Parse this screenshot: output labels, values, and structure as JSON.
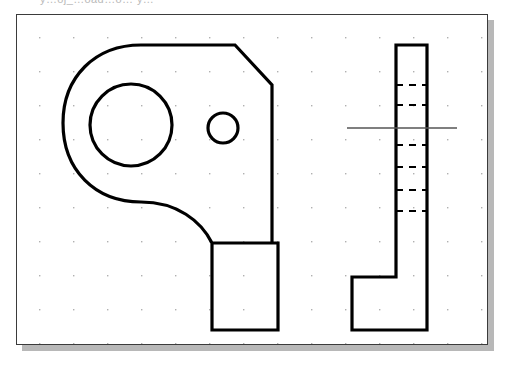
{
  "app": {
    "ghost_text": "y…oj_…oad…o… y…",
    "canvas_label": "cad-drawing-canvas"
  },
  "canvas": {
    "background_color": "#ffffff",
    "border_color": "#3b3b3b",
    "shadow_color": "#b8b8b8",
    "grid": {
      "visible": true,
      "dot_color": "#b0b0b0",
      "spacing_x": 34,
      "spacing_y": 34,
      "origin_x": 22,
      "origin_y": 22
    },
    "width": 472,
    "height": 331
  },
  "drawing": {
    "title": "mechanical-part-orthographic-views",
    "line_color": "#000000",
    "line_width": 3,
    "centerline_color": "#555555",
    "views": [
      {
        "name": "front-view",
        "description": "Rounded L-shaped bracket profile with large circular hole, small circular hole and angled chamfer at upper right",
        "outline_points": "125,33 220,33 256,72 256,230 196,230 196,317 262,317 262,230",
        "large_hole": {
          "cx": 132,
          "cy": 133,
          "r": 40
        },
        "small_hole": {
          "cx": 223,
          "cy": 133,
          "r": 15
        }
      },
      {
        "name": "side-view",
        "description": "Tall thin rectangular side profile with stepped foot at bottom and hidden hole lines",
        "hidden_line_color": "#000000",
        "centerline": {
          "x1": 345,
          "y1": 133,
          "x2": 450,
          "y2": 133
        }
      }
    ]
  }
}
